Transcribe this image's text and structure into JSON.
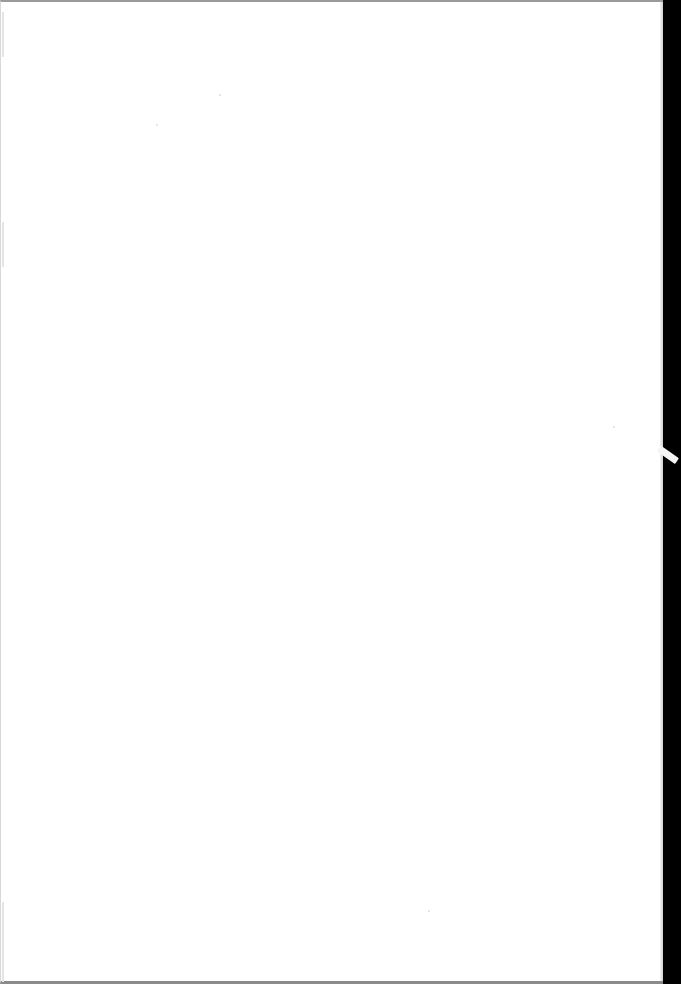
{
  "document": {
    "type": "scanned-page",
    "content_text": "",
    "is_blank": true
  },
  "colors": {
    "page_background": "#ffffff",
    "scanner_bed": "#000000",
    "border_top": "#9a9a9a",
    "border_bottom": "#8a8a8a",
    "tab": "#f4f4f4"
  },
  "specks": [
    {
      "x": 155,
      "y": 122
    },
    {
      "x": 218,
      "y": 92
    },
    {
      "x": 612,
      "y": 424
    },
    {
      "x": 427,
      "y": 908
    }
  ]
}
